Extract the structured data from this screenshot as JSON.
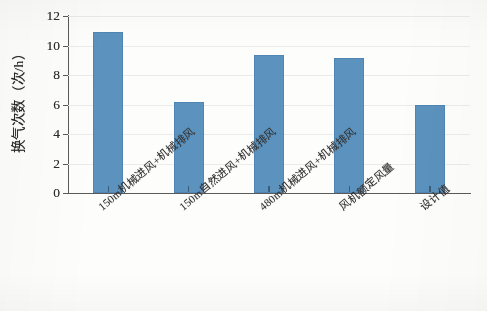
{
  "chart_data": {
    "type": "bar",
    "title": "",
    "subtitle": "",
    "xlabel": "",
    "ylabel": "换气次数（次/h）",
    "categories": [
      "150m机械进风+机械排风",
      "150m自然进风+机械排风",
      "480m机械进风+机械排风",
      "风机额定风量",
      "设计值"
    ],
    "values": [
      10.9,
      6.2,
      9.35,
      9.15,
      6.0
    ],
    "ylim": [
      0,
      12
    ],
    "yticks": [
      0,
      2,
      4,
      6,
      8,
      10,
      12
    ],
    "ytick_labels": [
      "0",
      "2",
      "4",
      "6",
      "8",
      "10",
      "12"
    ],
    "grid": true,
    "grid_axis": "y",
    "legend": false,
    "legend_position": "none",
    "bar_color": "#5b92be",
    "axis_color": "#5a5a5a",
    "grid_color": "#e9ebec",
    "background_color": "#fdfdfc"
  }
}
